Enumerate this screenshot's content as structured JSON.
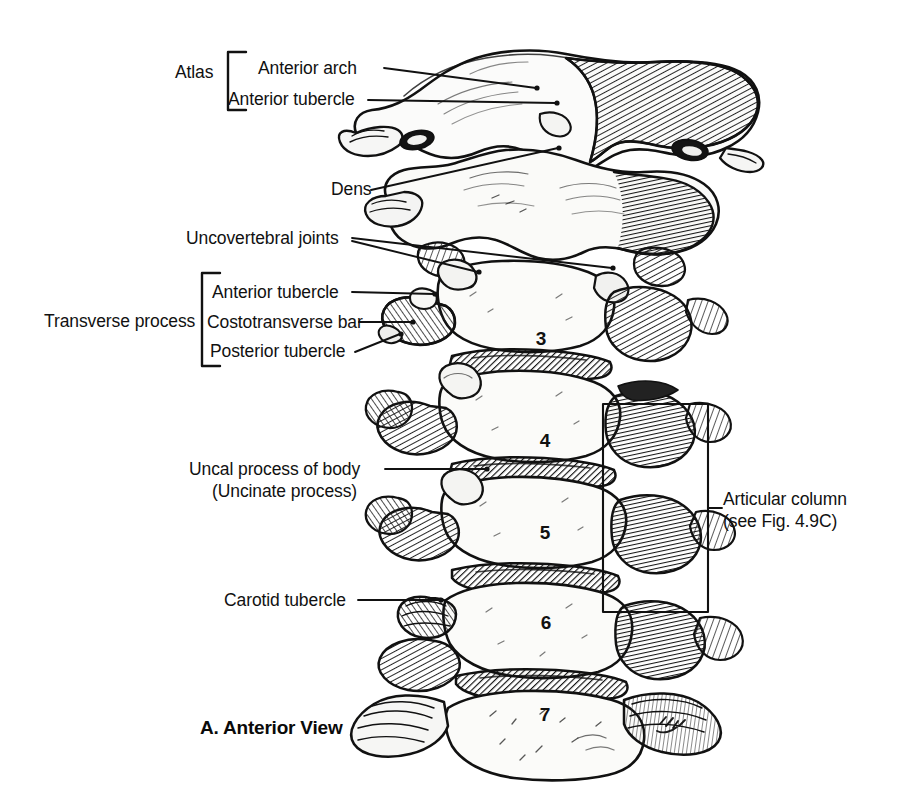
{
  "figure": {
    "caption": "A. Anterior View",
    "artist_signature": "M.J.V.",
    "background_color": "#ffffff",
    "ink_color": "#111111"
  },
  "brackets": [
    {
      "name": "atlas",
      "label": "Atlas"
    },
    {
      "name": "transverse-process",
      "label": "Transverse process"
    }
  ],
  "labels": [
    {
      "name": "anterior-arch",
      "text": "Anterior arch"
    },
    {
      "name": "anterior-tubercle-atlas",
      "text": "Anterior tubercle"
    },
    {
      "name": "dens",
      "text": "Dens"
    },
    {
      "name": "uncovertebral-joints",
      "text": "Uncovertebral joints"
    },
    {
      "name": "anterior-tubercle-tp",
      "text": "Anterior tubercle"
    },
    {
      "name": "costotransverse-bar",
      "text": "Costotransverse bar"
    },
    {
      "name": "posterior-tubercle",
      "text": "Posterior tubercle"
    },
    {
      "name": "uncal-process-line1",
      "text": "Uncal process of body"
    },
    {
      "name": "uncal-process-line2",
      "text": "(Uncinate process)"
    },
    {
      "name": "carotid-tubercle",
      "text": "Carotid tubercle"
    },
    {
      "name": "articular-column-line1",
      "text": "Articular column"
    },
    {
      "name": "articular-column-line2",
      "text": "(see Fig. 4.9C)"
    }
  ],
  "vertebra_numbers": [
    {
      "name": "vertebra-c3",
      "text": "3"
    },
    {
      "name": "vertebra-c4",
      "text": "4"
    },
    {
      "name": "vertebra-c5",
      "text": "5"
    },
    {
      "name": "vertebra-c6",
      "text": "6"
    },
    {
      "name": "vertebra-c7",
      "text": "7"
    }
  ],
  "callout_box": {
    "name": "articular-column-box",
    "label": "Articular column (see Fig. 4.9C)"
  }
}
